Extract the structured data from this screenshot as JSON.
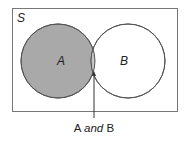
{
  "diagram": {
    "type": "venn",
    "universe_label": "S",
    "sets": [
      {
        "label": "A",
        "fill": "#a9a9a9"
      },
      {
        "label": "B",
        "fill": "#ffffff"
      }
    ],
    "intersection": {
      "fill": "#c6c6c6"
    },
    "annotation": {
      "prefix": "A ",
      "emphasis": "and",
      "suffix": " B"
    },
    "colors": {
      "stroke": "#555555",
      "frame": "#777777"
    }
  }
}
